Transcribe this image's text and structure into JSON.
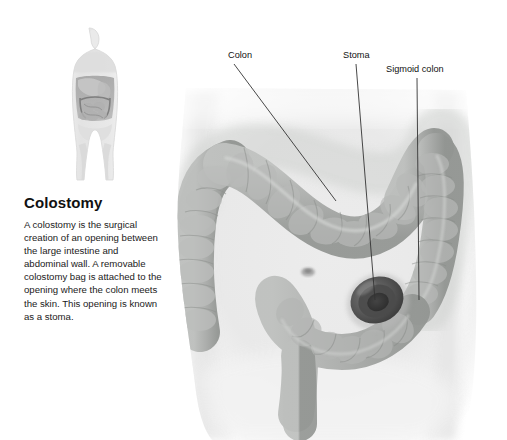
{
  "illustration": {
    "title": "Colostomy",
    "subject": "colostomy-anatomy-diagram",
    "background_color": "#ffffff"
  },
  "caption": {
    "heading": "Colostomy",
    "body": "A colostomy is the surgical creation of an opening between the large intestine and abdominal wall. A removable colostomy bag is attached to the opening where the colon meets the skin. This opening is known as a stoma."
  },
  "callouts": [
    {
      "id": "colon",
      "label": "Colon"
    },
    {
      "id": "stoma",
      "label": "Stoma"
    },
    {
      "id": "sigmoid",
      "label": "Sigmoid colon"
    }
  ],
  "anatomy": {
    "thumbnail_figure": "full-body-anatomy-thumbnail",
    "main_figure": "abdomen-with-large-intestine",
    "parts": [
      "transverse-colon",
      "ascending-colon",
      "descending-colon",
      "sigmoid-colon",
      "stoma-opening",
      "navel"
    ]
  },
  "colors": {
    "skin_light": "#ececec",
    "skin_shadow": "#d4d4d4",
    "colon_fill": "#b0b2b0",
    "colon_shadow": "#959895",
    "stoma_outer": "#6a6a6a",
    "stoma_inner": "#3c3c3c",
    "leader_line": "#3a3a3a",
    "text": "#111111"
  }
}
